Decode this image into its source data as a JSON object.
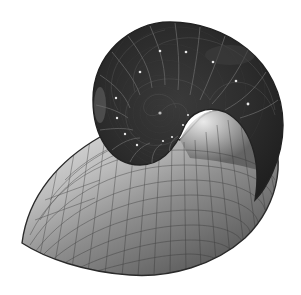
{
  "figure": {
    "background": "#ffffff",
    "colors": {
      "outline": "#2a2a2a",
      "shell_dark": "#2e2e2e",
      "shell_mid": "#4a4a4a",
      "lip_light": "#e6e6e6",
      "lip_mid": "#9a9a9a",
      "lip_dark": "#555555",
      "grid": "#333333",
      "siphuncle_dot": "#e8e8e8"
    },
    "spiral_center": [
      160,
      113
    ],
    "outer_bounds": {
      "left": 22,
      "top": 22,
      "right": 283,
      "bottom": 275
    }
  }
}
